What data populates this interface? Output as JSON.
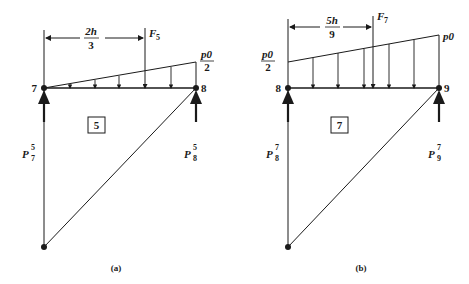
{
  "figure": {
    "panels": [
      {
        "id": "a",
        "caption": "(a)",
        "element_label": "5",
        "node_left": "7",
        "node_right": "8",
        "load_left_label": "",
        "load_right_label_num": "p0",
        "load_right_label_den": "2",
        "force_label": "F",
        "force_sub": "5",
        "dim_num": "2h",
        "dim_den": "3",
        "reaction_left": {
          "base": "P",
          "sup": "5",
          "sub": "7"
        },
        "reaction_right": {
          "base": "P",
          "sup": "5",
          "sub": "8"
        }
      },
      {
        "id": "b",
        "caption": "(b)",
        "element_label": "7",
        "node_left": "8",
        "node_right": "9",
        "load_left_label_num": "p0",
        "load_left_label_den": "2",
        "load_right_label": "p0",
        "force_label": "F",
        "force_sub": "7",
        "dim_num": "5h",
        "dim_den": "9",
        "reaction_left": {
          "base": "P",
          "sup": "7",
          "sub": "8"
        },
        "reaction_right": {
          "base": "P",
          "sup": "7",
          "sub": "9"
        }
      }
    ]
  }
}
